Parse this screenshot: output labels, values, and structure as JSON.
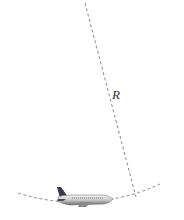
{
  "diagram": {
    "type": "aircraft-turn-radius",
    "radius_label": "R",
    "elements": {
      "radius_line": {
        "x1": 85,
        "y1": 3,
        "x2": 136,
        "y2": 197,
        "style": "dashed"
      },
      "flight_arc": {
        "style": "dashed",
        "path": "M18,193 Q60,206 100,201 Q132,197 160,184"
      },
      "airplane": {
        "x": 55,
        "y": 186,
        "width": 58,
        "height": 22,
        "orientation": "facing-right"
      }
    },
    "colors": {
      "dash": "#8a8a8a",
      "fuselage_light": "#e6e6e6",
      "fuselage_dark": "#7a7a7a",
      "tail": "#3a3a4a",
      "label": "#333333"
    }
  }
}
